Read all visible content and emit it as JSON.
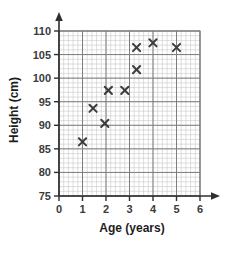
{
  "chart_data": {
    "type": "scatter",
    "title": "",
    "xlabel": "Age (years)",
    "ylabel": "Height (cm)",
    "xlim": [
      0,
      6
    ],
    "ylim": [
      75,
      110
    ],
    "xticks": [
      0,
      1,
      2,
      3,
      4,
      5,
      6
    ],
    "yticks": [
      75,
      80,
      85,
      90,
      95,
      100,
      105,
      110
    ],
    "xtick_labels": [
      "0",
      "1",
      "2",
      "3",
      "4",
      "5",
      "6"
    ],
    "ytick_labels": [
      "75",
      "80",
      "85",
      "90",
      "95",
      "100",
      "105",
      "110"
    ],
    "grid": true,
    "grid_major_step_x": 1,
    "grid_major_step_y": 5,
    "grid_minor_step_x": 0.2,
    "grid_minor_step_y": 1,
    "legend": null,
    "marker": "x",
    "marker_color": "#3c3c3c",
    "points": [
      {
        "x": 1.0,
        "y": 86.5,
        "label": "1.0, 86.5"
      },
      {
        "x": 1.45,
        "y": 93.6,
        "label": "1.45, 93.6"
      },
      {
        "x": 1.95,
        "y": 90.4,
        "label": "1.95, 90.4"
      },
      {
        "x": 2.1,
        "y": 97.4,
        "label": "2.1, 97.4"
      },
      {
        "x": 2.8,
        "y": 97.4,
        "label": "2.8, 97.4"
      },
      {
        "x": 3.3,
        "y": 101.8,
        "label": "3.3, 101.8"
      },
      {
        "x": 3.3,
        "y": 106.5,
        "label": "3.3, 106.5"
      },
      {
        "x": 4.0,
        "y": 107.5,
        "label": "4.0, 107.5"
      },
      {
        "x": 5.0,
        "y": 106.5,
        "label": "5.0, 106.5"
      }
    ]
  },
  "colors": {
    "axis": "#2f2f2f",
    "grid_major": "#7d7d7d",
    "grid_minor": "#c8c8c8",
    "marker": "#3c3c3c",
    "text": "#1d1d1d",
    "background": "#ffffff"
  }
}
